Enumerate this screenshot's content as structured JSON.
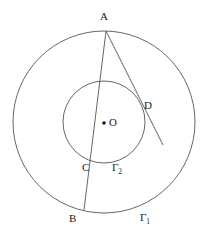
{
  "figure": {
    "background_color": "#ffffff",
    "stroke_color": "#4a4a4a",
    "label_color": "#1a1a1a"
  },
  "labels": {
    "A": "A",
    "B": "B",
    "C": "C",
    "D": "D",
    "O": "O",
    "gamma1_base": "Γ",
    "gamma1_sub": "1",
    "gamma2_base": "Γ",
    "gamma2_sub": "2"
  },
  "geometry": {
    "center": {
      "x": 104,
      "y": 122
    },
    "outer_circle": {
      "name": "Γ₁",
      "cx": 104,
      "cy": 122,
      "r": 91
    },
    "inner_circle": {
      "name": "Γ₂",
      "cx": 104,
      "cy": 122,
      "r": 41
    },
    "center_dot": {
      "x": 104,
      "y": 123,
      "r": 1.8
    },
    "points": {
      "A": {
        "x": 106,
        "y": 31
      },
      "B": {
        "x": 84,
        "y": 210
      },
      "C": {
        "x": 91,
        "y": 160
      },
      "D": {
        "x": 141,
        "y": 109
      }
    },
    "segments": [
      {
        "name": "segment-A-B",
        "x1": 106,
        "y1": 31,
        "x2": 84,
        "y2": 210
      },
      {
        "name": "segment-A-tangent",
        "x1": 106,
        "y1": 31,
        "x2": 163,
        "y2": 145
      }
    ]
  }
}
